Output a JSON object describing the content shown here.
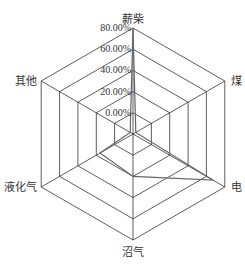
{
  "chart_data": {
    "type": "radar",
    "title": "",
    "categories": [
      "薪柴",
      "煤",
      "电",
      "沼气",
      "液化气",
      "其他"
    ],
    "series": [
      {
        "name": "",
        "values": [
          80,
          -17,
          67,
          20,
          16,
          -17
        ],
        "color": "#666666"
      }
    ],
    "axis": {
      "min": -20,
      "max": 80,
      "step": 20,
      "tick_labels": [
        "0.00%",
        "20.00%",
        "40.00%",
        "60.00%",
        "80.00%"
      ],
      "tick_values": [
        0,
        20,
        40,
        60,
        80
      ]
    },
    "grid": true,
    "legend": "none",
    "colors": {
      "grid": "#333333",
      "series": "#666666",
      "text": "#333333"
    }
  },
  "layout": {
    "cx": 133,
    "cy": 134,
    "radius": 106
  }
}
